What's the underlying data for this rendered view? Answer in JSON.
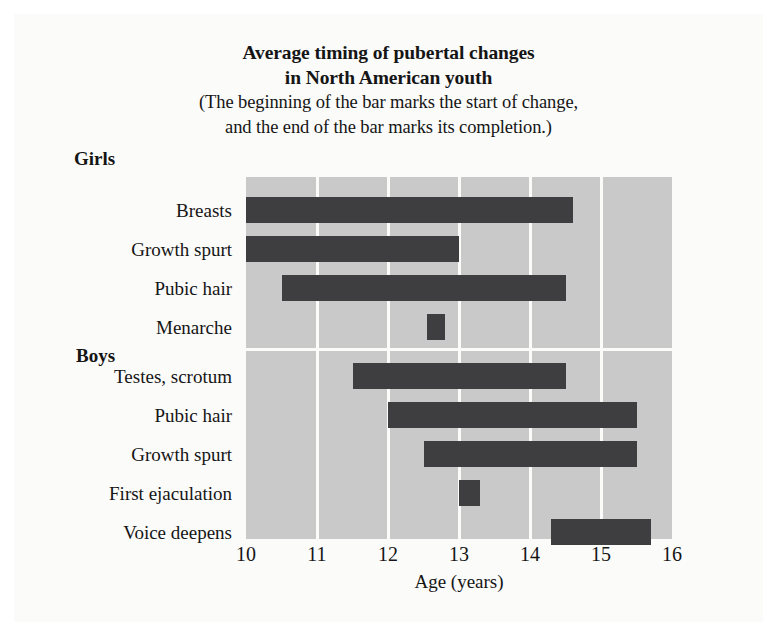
{
  "title": {
    "line1": "Average timing of pubertal changes",
    "line2": "in North American youth",
    "note1": "(The beginning of the bar marks the start of change,",
    "note2": "and the end of the bar marks its completion.)"
  },
  "chart_data": {
    "type": "bar",
    "orientation": "horizontal",
    "variant": "range-bar",
    "title": "Average timing of pubertal changes in North American youth",
    "subtitle": "(The beginning of the bar marks the start of change, and the end of the bar marks its completion.)",
    "xlabel": "Age (years)",
    "ylabel": "",
    "xlim": [
      10,
      16
    ],
    "xticks": [
      10,
      11,
      12,
      13,
      14,
      15,
      16
    ],
    "xtick_labels": [
      "10",
      "11",
      "12",
      "13",
      "14",
      "15",
      "16"
    ],
    "grid": "vertical",
    "legend": "none",
    "bar_color": "#3e3e40",
    "plot_background": "#c9c9c9",
    "gridline_color": "#fbfbfa",
    "groups": [
      {
        "name": "Girls",
        "categories": [
          "Breasts",
          "Growth spurt",
          "Pubic hair",
          "Menarche"
        ],
        "ranges": [
          {
            "label": "Breasts",
            "start": 10.0,
            "end": 14.6
          },
          {
            "label": "Growth spurt",
            "start": 10.0,
            "end": 13.0
          },
          {
            "label": "Pubic hair",
            "start": 10.5,
            "end": 14.5
          },
          {
            "label": "Menarche",
            "start": 12.55,
            "end": 12.8
          }
        ]
      },
      {
        "name": "Boys",
        "categories": [
          "Testes, scrotum",
          "Pubic hair",
          "Growth spurt",
          "First ejaculation",
          "Voice deepens"
        ],
        "ranges": [
          {
            "label": "Testes, scrotum",
            "start": 11.5,
            "end": 14.5
          },
          {
            "label": "Pubic hair",
            "start": 12.0,
            "end": 15.5
          },
          {
            "label": "Growth spurt",
            "start": 12.5,
            "end": 15.5
          },
          {
            "label": "First ejaculation",
            "start": 13.0,
            "end": 13.3
          },
          {
            "label": "Voice deepens",
            "start": 14.3,
            "end": 15.7
          }
        ]
      }
    ]
  }
}
